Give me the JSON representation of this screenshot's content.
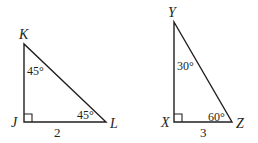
{
  "triangles": [
    {
      "name": "JKL",
      "vertices": {
        "top": {
          "label": "K",
          "x": 24,
          "y": 44
        },
        "right_angle": {
          "label": "J",
          "x": 24,
          "y": 122
        },
        "end": {
          "label": "L",
          "x": 106,
          "y": 122
        }
      },
      "angles": {
        "top": "45°",
        "end": "45°"
      },
      "base_length": "2"
    },
    {
      "name": "XYZ",
      "vertices": {
        "top": {
          "label": "Y",
          "x": 174,
          "y": 22
        },
        "right_angle": {
          "label": "X",
          "x": 174,
          "y": 122
        },
        "end": {
          "label": "Z",
          "x": 232,
          "y": 122
        }
      },
      "angles": {
        "top": "30°",
        "end": "60°"
      },
      "base_length": "3"
    }
  ],
  "colors": {
    "stroke": "#231f20",
    "background": "#ffffff"
  }
}
